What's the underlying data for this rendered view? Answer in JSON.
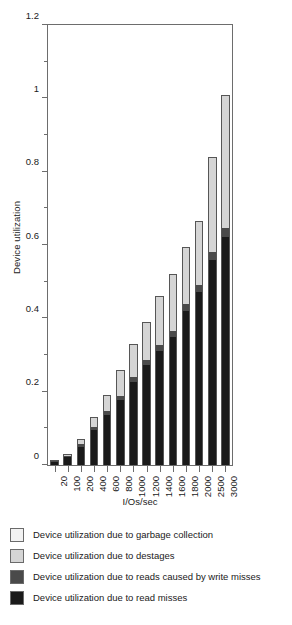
{
  "chart_data": {
    "type": "bar",
    "stacked": true,
    "title": "",
    "xlabel": "I/Os/sec",
    "ylabel": "Device utilization",
    "ylim": [
      0,
      1.2
    ],
    "ytick_labels": [
      "0",
      "0.2",
      "0.4",
      "0.6",
      "0.8",
      "1",
      "1.2"
    ],
    "ytick_values": [
      0,
      0.2,
      0.4,
      0.6,
      0.8,
      1.0,
      1.2
    ],
    "yminor_values": [
      0.1,
      0.3,
      0.5,
      0.7,
      0.9,
      1.1
    ],
    "grid": false,
    "legend_position": "below-plot",
    "categories": [
      "20",
      "100",
      "200",
      "400",
      "600",
      "800",
      "1000",
      "1200",
      "1400",
      "1600",
      "1800",
      "2000",
      "2500",
      "3000"
    ],
    "series": [
      {
        "name": "Device utilization due to read misses",
        "color": "#1a1a1a",
        "values": [
          0.007,
          0.021,
          0.048,
          0.095,
          0.137,
          0.178,
          0.226,
          0.272,
          0.312,
          0.35,
          0.42,
          0.471,
          0.558,
          0.622
        ]
      },
      {
        "name": "Device utilization due to reads caused by write misses",
        "color": "#4a4a4a",
        "values": [
          0.001,
          0.004,
          0.008,
          0.009,
          0.01,
          0.011,
          0.013,
          0.014,
          0.015,
          0.016,
          0.018,
          0.02,
          0.022,
          0.025
        ]
      },
      {
        "name": "Device utilization due to destages",
        "color": "#d5d5d5",
        "values": [
          0.002,
          0.005,
          0.014,
          0.026,
          0.043,
          0.071,
          0.091,
          0.104,
          0.133,
          0.154,
          0.157,
          0.174,
          0.26,
          0.363
        ]
      },
      {
        "name": "Device utilization due to garbage collection",
        "color": "#f2f2f2",
        "values": [
          0.0,
          0.0,
          0.0,
          0.0,
          0.0,
          0.0,
          0.0,
          0.0,
          0.0,
          0.0,
          0.0,
          0.0,
          0.0,
          0.0
        ]
      }
    ],
    "totals": [
      0.01,
      0.03,
      0.07,
      0.13,
      0.19,
      0.26,
      0.33,
      0.39,
      0.46,
      0.52,
      0.595,
      0.665,
      0.84,
      1.01
    ]
  },
  "legend": {
    "items": [
      {
        "label": "Device utilization due to garbage collection",
        "color": "#f2f2f2"
      },
      {
        "label": "Device utilization due to destages",
        "color": "#d5d5d5"
      },
      {
        "label": "Device utilization due to reads caused by write misses",
        "color": "#4a4a4a"
      },
      {
        "label": "Device utilization due to read misses",
        "color": "#1a1a1a"
      }
    ]
  },
  "caption": {
    "text": ""
  },
  "colors": {
    "axis": "#6d6d6d",
    "bar_outline": "#565656",
    "text": "#1a1a1a",
    "background": "#ffffff"
  }
}
